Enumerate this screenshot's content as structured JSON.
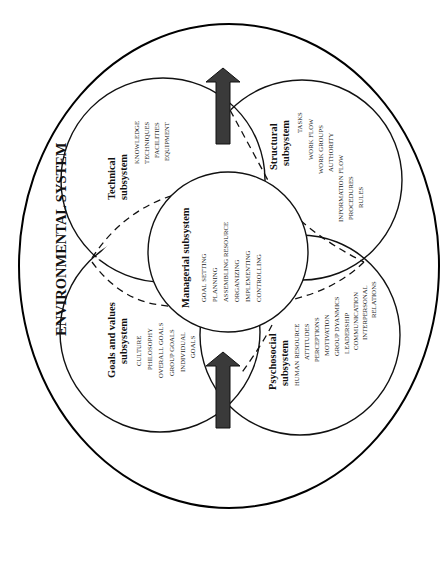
{
  "diagram": {
    "orientation": "rotated-90-ccw",
    "title": "ENVIRONMENTAL SYSTEM",
    "colors": {
      "line": "#111111",
      "arrow_fill": "#3a3a3a",
      "background": "#ffffff"
    },
    "subsystems": {
      "technical": {
        "heading_1": "Technical",
        "heading_2": "subsystem",
        "items": [
          "KNOWLEDGE",
          "TECHNIQUES",
          "FACILITIES",
          "EQUIPMENT"
        ]
      },
      "structural": {
        "heading_1": "Structural",
        "heading_2": "subsystem",
        "items": [
          "TASKS",
          "WORK FLOW",
          "WORK GROUPS",
          "AUTHORITY",
          "INFORMATION FLOW",
          "PROCEDURES",
          "RULES"
        ]
      },
      "managerial": {
        "heading": "Managerial subsystem",
        "items": [
          "GOAL SETTING",
          "PLANNING",
          "ASSEMBLING RESOURCE",
          "ORGANIZING",
          "IMPLEMENTING",
          "CONTROLLING"
        ]
      },
      "goals": {
        "heading_1": "Goals and values",
        "heading_2": "subsystem",
        "items": [
          "CULTURE",
          "PHILOSOPHY",
          "OVERALL GOALS",
          "GROUP GOALS",
          "INDIVIDUAL",
          "GOALS"
        ]
      },
      "psychosocial": {
        "heading_1": "Psychosocial",
        "heading_2": "subsystem",
        "items": [
          "HUMAN RESOURCE",
          "ATTITUDES",
          "PERCEPTIONS",
          "MOTIVATION",
          "GROUP DYANMICS",
          "LEADERSHIP",
          "COMMUNICATION",
          "INTERPERSONAL",
          "RELATIONS"
        ]
      }
    },
    "arrows": [
      {
        "name": "input-arrow",
        "position": "bottom"
      },
      {
        "name": "output-arrow",
        "position": "top"
      }
    ]
  }
}
